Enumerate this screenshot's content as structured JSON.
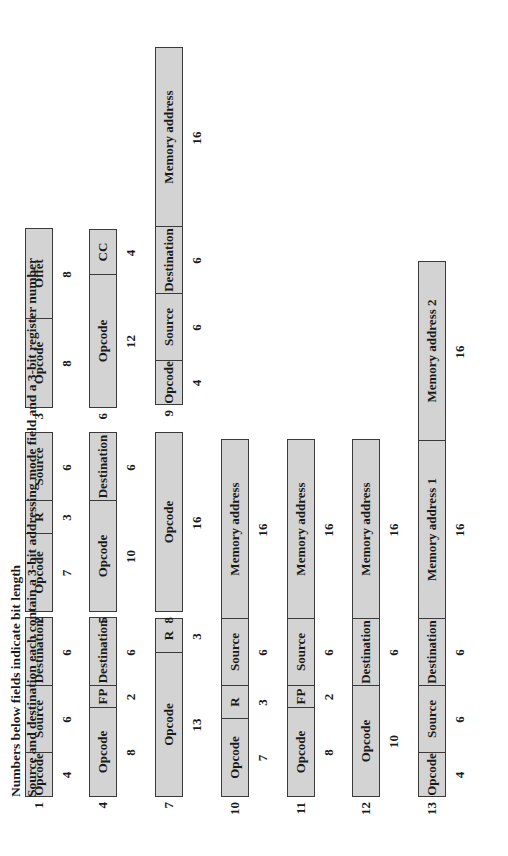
{
  "diagram": {
    "px_per_bit": 11.1,
    "formats": [
      {
        "id": "1",
        "x": 59,
        "y": 455,
        "fields": [
          {
            "label": "Opcode",
            "bits": "4"
          },
          {
            "label": "Source",
            "bits": "6"
          },
          {
            "label": "Destination",
            "bits": "6"
          }
        ]
      },
      {
        "id": "2",
        "x": 244,
        "y": 455,
        "fields": [
          {
            "label": "Opcode",
            "bits": "7"
          },
          {
            "label": "R",
            "bits": "3"
          },
          {
            "label": "Source",
            "bits": "6"
          }
        ]
      },
      {
        "id": "3",
        "x": 448,
        "y": 455,
        "fields": [
          {
            "label": "Opcode",
            "bits": "8"
          },
          {
            "label": "Offet",
            "bits": "8"
          }
        ]
      },
      {
        "id": "4",
        "x": 59,
        "y": 391,
        "fields": [
          {
            "label": "Opcode",
            "bits": "8"
          },
          {
            "label": "FP",
            "bits": "2"
          },
          {
            "label": "Destination",
            "bits": "6"
          }
        ]
      },
      {
        "id": "5",
        "x": 244,
        "y": 391,
        "fields": [
          {
            "label": "Opcode",
            "bits": "10"
          },
          {
            "label": "Destination",
            "bits": "6"
          }
        ]
      },
      {
        "id": "6",
        "x": 448,
        "y": 391,
        "fields": [
          {
            "label": "Opcode",
            "bits": "12"
          },
          {
            "label": "CC",
            "bits": "4"
          }
        ]
      },
      {
        "id": "7",
        "x": 59,
        "y": 325,
        "fields": [
          {
            "label": "Opcode",
            "bits": "13"
          },
          {
            "label": "R",
            "bits": "3"
          }
        ]
      },
      {
        "id": "8",
        "x": 244,
        "y": 325,
        "fields": [
          {
            "label": "Opcode",
            "bits": "16"
          }
        ]
      },
      {
        "id": "9",
        "x": 451,
        "y": 325,
        "fields": [
          {
            "label": "Opcode",
            "bits": "4"
          },
          {
            "label": "Source",
            "bits": "6"
          },
          {
            "label": "Destination",
            "bits": "6"
          },
          {
            "label": "Memory address",
            "bits": "16"
          }
        ]
      },
      {
        "id": "10",
        "x": 59,
        "y": 259,
        "fields": [
          {
            "label": "Opcode",
            "bits": "7"
          },
          {
            "label": "R",
            "bits": "3"
          },
          {
            "label": "Source",
            "bits": "6"
          },
          {
            "label": "Memory address",
            "bits": "16"
          }
        ]
      },
      {
        "id": "11",
        "x": 59,
        "y": 193,
        "fields": [
          {
            "label": "Opcode",
            "bits": "8"
          },
          {
            "label": "FP",
            "bits": "2"
          },
          {
            "label": "Source",
            "bits": "6"
          },
          {
            "label": "Memory address",
            "bits": "16"
          }
        ]
      },
      {
        "id": "12",
        "x": 59,
        "y": 128,
        "fields": [
          {
            "label": "Opcode",
            "bits": "10"
          },
          {
            "label": "Destination",
            "bits": "6"
          },
          {
            "label": "Memory address",
            "bits": "16"
          }
        ]
      },
      {
        "id": "13",
        "x": 59,
        "y": 62,
        "fields": [
          {
            "label": "Opcode",
            "bits": "4"
          },
          {
            "label": "Source",
            "bits": "6"
          },
          {
            "label": "Destination",
            "bits": "6"
          },
          {
            "label": "Memory address 1",
            "bits": "16"
          },
          {
            "label": "Memory address 2",
            "bits": "16"
          }
        ]
      }
    ],
    "notes": [
      "Numbers below fields indicate bit length",
      "Source and destination each contain a 3-bit addressing mode field and a 3-bit register number"
    ]
  }
}
